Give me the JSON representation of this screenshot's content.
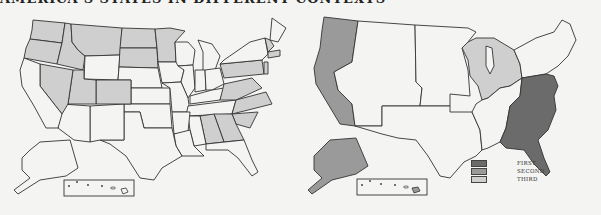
{
  "title": "AMERICA'S STATES IN DIFFERENT CONTEXTS",
  "colors": {
    "background": "#f4f4f2",
    "stroke": "#333333",
    "unfilled": "#f4f4f2",
    "left_fill": "#cfcfcf",
    "first": "#6b6b6b",
    "second": "#9a9a9a",
    "third": "#cfcfcf"
  },
  "maps": {
    "left": {
      "description": "US state map with selected states shaded light gray",
      "shaded_states": [
        "WA",
        "OR",
        "ID",
        "MT",
        "ND",
        "SD",
        "MN",
        "NV",
        "UT",
        "CO",
        "PA",
        "VA",
        "NC",
        "SC",
        "GA",
        "AL",
        "VT",
        "NH",
        "MA",
        "CT",
        "NJ"
      ]
    },
    "right": {
      "description": "US regional map with three shading levels",
      "regions": {
        "first": "East coast (Atlantic states NY/PA south to FL)",
        "second": "West coast (WA, OR, CA) and Alaska",
        "third": "Great Lakes region (WI, MI, IL, IN, OH)"
      }
    }
  },
  "legend": {
    "items": [
      {
        "label": "FIRST",
        "color": "#6b6b6b"
      },
      {
        "label": "SECOND",
        "color": "#9a9a9a"
      },
      {
        "label": "THIRD",
        "color": "#cfcfcf"
      }
    ]
  }
}
